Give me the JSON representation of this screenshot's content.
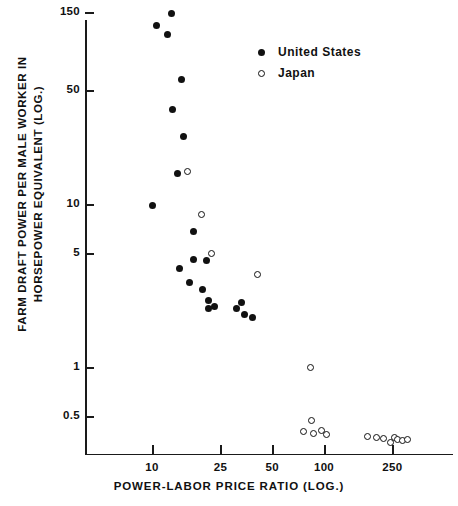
{
  "chart_data": {
    "type": "scatter",
    "title": "",
    "xlabel": "POWER-LABOR PRICE RATIO (LOG.)",
    "ylabel": "FARM DRAFT POWER PER MALE WORKER IN HORSEPOWER EQUIVALENT (LOG.)",
    "ylabel_line1": "FARM DRAFT POWER PER MALE WORKER IN",
    "ylabel_line2": "HORSEPOWER EQUIVALENT (LOG.)",
    "xscale": "log",
    "yscale": "log",
    "xlim": [
      6.2,
      430
    ],
    "ylim": [
      0.33,
      165
    ],
    "grid": false,
    "xticks": [
      10,
      25,
      50,
      100,
      250
    ],
    "xtick_labels": [
      "10",
      "25",
      "50",
      "100",
      "250"
    ],
    "yticks": [
      150,
      50,
      10,
      5,
      1,
      0.5
    ],
    "ytick_labels": [
      "150",
      "50",
      "10",
      "5",
      "1",
      "0.5"
    ],
    "legend_position": "top-right",
    "series": [
      {
        "name": "United States",
        "marker": "filled-circle",
        "color": "#111111",
        "points": [
          [
            13.0,
            148
          ],
          [
            10.6,
            125
          ],
          [
            12.3,
            110
          ],
          [
            14.8,
            58
          ],
          [
            13.2,
            38
          ],
          [
            15.2,
            26
          ],
          [
            14.0,
            15.5
          ],
          [
            10.0,
            9.8
          ],
          [
            17.5,
            6.8
          ],
          [
            17.4,
            4.6
          ],
          [
            20.8,
            4.5
          ],
          [
            14.4,
            4.0
          ],
          [
            16.5,
            3.3
          ],
          [
            19.6,
            3.0
          ],
          [
            21.3,
            2.55
          ],
          [
            21.3,
            2.3
          ],
          [
            23.0,
            2.35
          ],
          [
            31.0,
            2.3
          ],
          [
            33.0,
            2.5
          ],
          [
            34.5,
            2.1
          ],
          [
            38.5,
            2.0
          ]
        ]
      },
      {
        "name": "Japan",
        "marker": "open-circle",
        "color": "#111111",
        "points": [
          [
            16.0,
            15.8
          ],
          [
            19.3,
            8.6
          ],
          [
            22.3,
            5.0
          ],
          [
            41.0,
            3.7
          ],
          [
            83.0,
            1.0
          ],
          [
            84.0,
            0.47
          ],
          [
            76.0,
            0.405
          ],
          [
            87.0,
            0.39
          ],
          [
            97.0,
            0.41
          ],
          [
            104.0,
            0.385
          ],
          [
            180.0,
            0.375
          ],
          [
            202.0,
            0.37
          ],
          [
            222.0,
            0.365
          ],
          [
            245.0,
            0.345
          ],
          [
            257.0,
            0.37
          ],
          [
            266.0,
            0.36
          ],
          [
            284.0,
            0.355
          ],
          [
            305.0,
            0.36
          ]
        ]
      }
    ]
  },
  "legend": {
    "items": [
      {
        "label": "United States",
        "marker": "filled-circle"
      },
      {
        "label": "Japan",
        "marker": "open-circle"
      }
    ]
  }
}
